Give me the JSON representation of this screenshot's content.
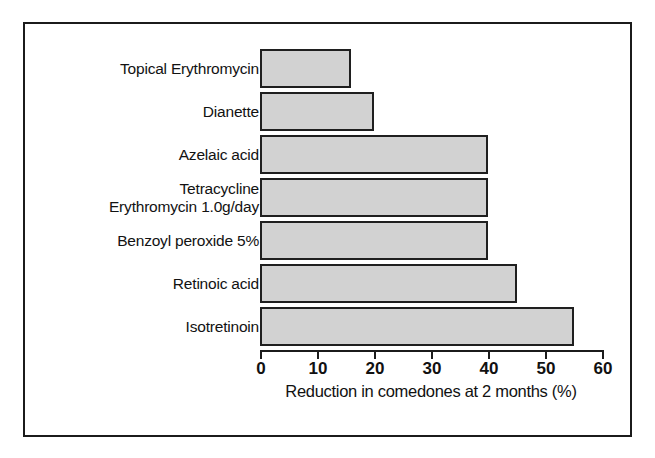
{
  "figure": {
    "frame_border_color": "#1b1b1b",
    "background_color": "#ffffff"
  },
  "chart_data": {
    "type": "bar",
    "orientation": "horizontal",
    "title": "",
    "xlabel": "Reduction in comedones at 2 months (%)",
    "ylabel": "",
    "xlim": [
      0,
      60
    ],
    "xticks": [
      0,
      10,
      20,
      30,
      40,
      50,
      60
    ],
    "xtick_labels": [
      "0",
      "10",
      "20",
      "30",
      "40",
      "50",
      "60"
    ],
    "grid": false,
    "legend": false,
    "bar_fill_color": "#d2d2d2",
    "bar_edge_color": "#1f1f1f",
    "categories": [
      "Topical Erythromycin",
      "Dianette",
      "Azelaic acid",
      "Tetracycline\nErythromycin 1.0g/day",
      "Benzoyl peroxide 5%",
      "Retinoic acid",
      "Isotretinoin"
    ],
    "values": [
      16,
      20,
      40,
      40,
      40,
      45,
      55
    ]
  }
}
